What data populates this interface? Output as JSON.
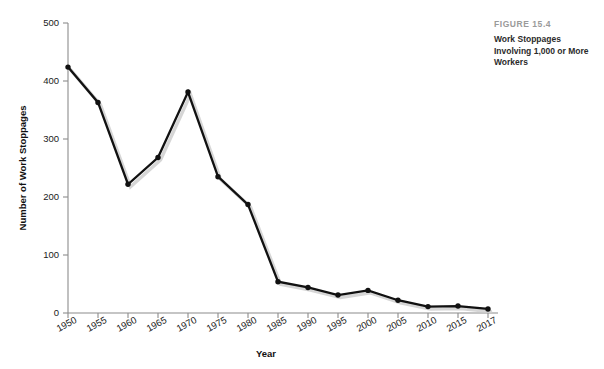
{
  "figure": {
    "eyebrow": "FIGURE 15.4",
    "title": "Work Stoppages Involving 1,000 or More Workers"
  },
  "colors": {
    "line": "#111111",
    "marker": "#111111",
    "axis": "#8c8c8c",
    "shadow": "#cfcfcf",
    "eyebrow_text": "#9a9a9a",
    "caption_text": "#2b2b2b",
    "background": "#ffffff"
  },
  "chart_data": {
    "type": "line",
    "title": "Work Stoppages Involving 1,000 or More Workers",
    "subtitle": "FIGURE 15.4",
    "xlabel": "Year",
    "ylabel": "Number of Work Stoppages",
    "x": [
      1950,
      1955,
      1960,
      1965,
      1970,
      1975,
      1980,
      1985,
      1990,
      1995,
      2000,
      2005,
      2010,
      2015,
      2017
    ],
    "categories": [
      "1950",
      "1955",
      "1960",
      "1965",
      "1970",
      "1975",
      "1980",
      "1985",
      "1990",
      "1995",
      "2000",
      "2005",
      "2010",
      "2015",
      "2017"
    ],
    "values": [
      424,
      363,
      222,
      268,
      381,
      235,
      187,
      54,
      44,
      31,
      39,
      22,
      11,
      12,
      7
    ],
    "series": [
      {
        "name": "Number of Work Stoppages",
        "values": [
          424,
          363,
          222,
          268,
          381,
          235,
          187,
          54,
          44,
          31,
          39,
          22,
          11,
          12,
          7
        ]
      }
    ],
    "xtick_labels": [
      "1950",
      "1955",
      "1960",
      "1965",
      "1970",
      "1975",
      "1980",
      "1985",
      "1990",
      "1995",
      "2000",
      "2005",
      "2010",
      "2015",
      "2017"
    ],
    "ytick_labels": [
      "0",
      "100",
      "200",
      "300",
      "400",
      "500"
    ],
    "yticks": [
      0,
      100,
      200,
      300,
      400,
      500
    ],
    "ylim": [
      0,
      500
    ],
    "xlim": [
      1950,
      2017
    ],
    "grid": false,
    "legend": false,
    "markers": true,
    "marker_shape": "circle"
  }
}
